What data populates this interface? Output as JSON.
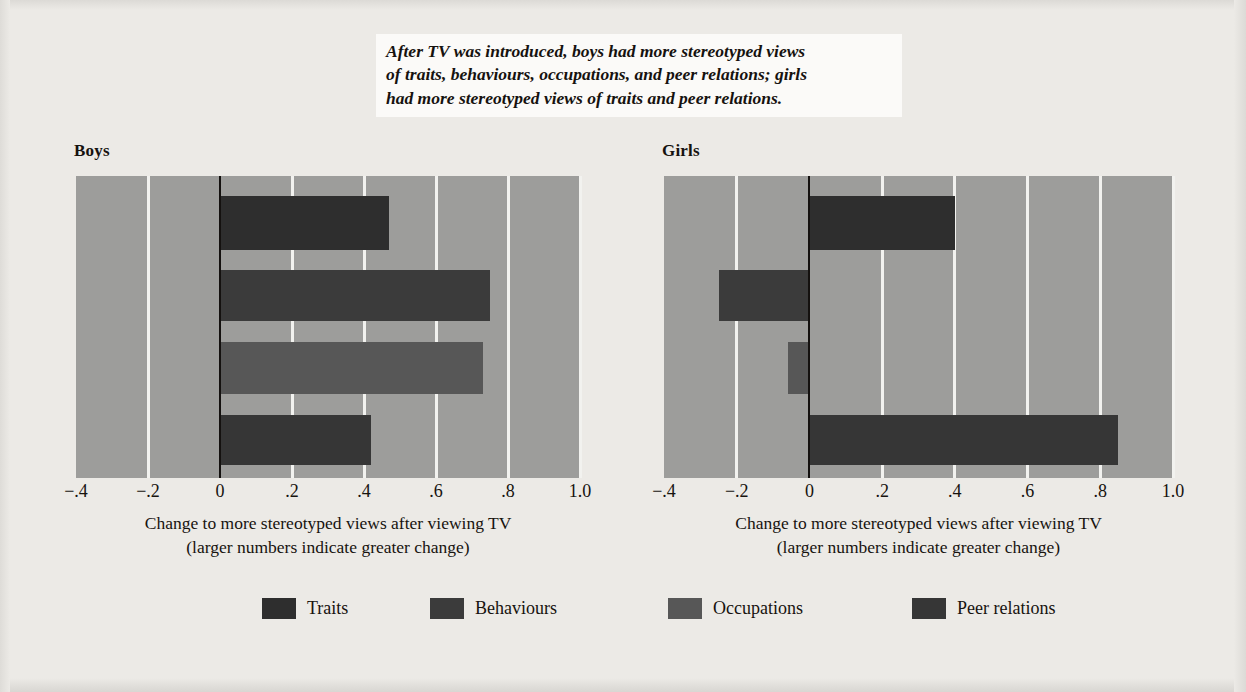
{
  "caption": {
    "line1": "After TV was introduced, boys had more stereotyped views",
    "line2": "of traits, behaviours, occupations, and peer relations; girls",
    "line3": "had more stereotyped views of traits and peer relations."
  },
  "axis": {
    "label_line1": "Change to more stereotyped views after viewing TV",
    "label_line2": "(larger numbers indicate greater change)",
    "ticks": [
      "−.4",
      "−.2",
      "0",
      ".2",
      ".4",
      ".6",
      ".8",
      "1.0"
    ]
  },
  "legend": {
    "items": [
      {
        "label": "Traits",
        "color": "#2e2e2e"
      },
      {
        "label": "Behaviours",
        "color": "#3b3b3b"
      },
      {
        "label": "Occupations",
        "color": "#575757"
      },
      {
        "label": "Peer relations",
        "color": "#363636"
      }
    ]
  },
  "colors": {
    "plot_background": "#9d9d9b",
    "gridline": "#f2f2ef",
    "zeroline": "#14110f",
    "page_background": "#eceae6",
    "caption_background": "#fbfaf8"
  },
  "chart_data": {
    "type": "bar",
    "orientation": "horizontal",
    "title": "After TV was introduced, boys had more stereotyped views of traits, behaviours, occupations, and peer relations; girls had more stereotyped views of traits and peer relations.",
    "xlabel": "Change to more stereotyped views after viewing TV (larger numbers indicate greater change)",
    "ylabel": "",
    "xlim": [
      -0.4,
      1.0
    ],
    "xticks": [
      -0.4,
      -0.2,
      0,
      0.2,
      0.4,
      0.6,
      0.8,
      1.0
    ],
    "xticklabels": [
      "−.4",
      "−.2",
      "0",
      ".2",
      ".4",
      ".6",
      ".8",
      "1.0"
    ],
    "grid": true,
    "legend_position": "bottom",
    "categories": [
      "Traits",
      "Behaviours",
      "Occupations",
      "Peer relations"
    ],
    "panels": [
      {
        "name": "Boys",
        "values": [
          0.47,
          0.75,
          0.73,
          0.42
        ]
      },
      {
        "name": "Girls",
        "values": [
          0.4,
          -0.25,
          -0.06,
          0.85
        ]
      }
    ]
  }
}
